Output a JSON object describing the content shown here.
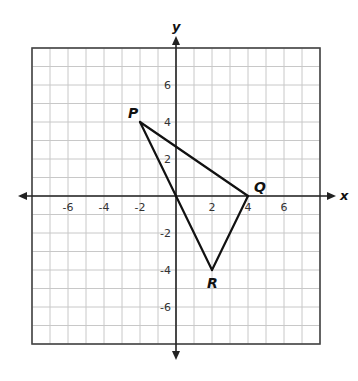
{
  "diagram": {
    "type": "coordinate-plane",
    "axes": {
      "x_label": "x",
      "y_label": "y"
    },
    "grid": {
      "x_min": -8,
      "x_max": 8,
      "y_min": -8,
      "y_max": 8
    },
    "x_ticks": [
      {
        "value": -6,
        "label": "-6"
      },
      {
        "value": -4,
        "label": "-4"
      },
      {
        "value": -2,
        "label": "-2"
      },
      {
        "value": 2,
        "label": "2"
      },
      {
        "value": 4,
        "label": "4"
      },
      {
        "value": 6,
        "label": "6"
      }
    ],
    "y_ticks": [
      {
        "value": 6,
        "label": "6"
      },
      {
        "value": 4,
        "label": "4"
      },
      {
        "value": 2,
        "label": "2"
      },
      {
        "value": -2,
        "label": "-2"
      },
      {
        "value": -4,
        "label": "-4"
      },
      {
        "value": -6,
        "label": "-6"
      }
    ],
    "points": [
      {
        "name": "P",
        "x": -2,
        "y": 4
      },
      {
        "name": "Q",
        "x": 4,
        "y": 0
      },
      {
        "name": "R",
        "x": 2,
        "y": -4
      }
    ],
    "segments": [
      {
        "from": [
          -2,
          4
        ],
        "to": [
          4,
          0
        ]
      },
      {
        "from": [
          4,
          0
        ],
        "to": [
          2,
          -4
        ]
      },
      {
        "from": [
          2,
          -4
        ],
        "to": [
          0,
          0
        ]
      },
      {
        "from": [
          0,
          0
        ],
        "to": [
          -2,
          4
        ]
      }
    ],
    "colors": {
      "grid": "#c8c8c8",
      "border": "#444444",
      "axis": "#222222",
      "figure": "#111111"
    }
  }
}
